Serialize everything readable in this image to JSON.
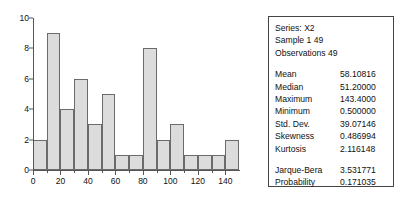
{
  "chart_data": {
    "type": "bar",
    "title": "",
    "xlabel": "",
    "ylabel": "",
    "bin_width": 10,
    "bin_start": 0,
    "grid": false,
    "legend": "none",
    "xlim": [
      0,
      150
    ],
    "ylim": [
      0,
      10
    ],
    "yticks": [
      0,
      2,
      4,
      6,
      8,
      10
    ],
    "xticks": [
      0,
      20,
      40,
      60,
      80,
      100,
      120,
      140
    ],
    "x_minor_ticks": [
      10,
      30,
      50,
      70,
      90,
      110,
      130
    ],
    "categories": [
      "0-10",
      "10-20",
      "20-30",
      "30-40",
      "40-50",
      "50-60",
      "60-70",
      "70-80",
      "80-90",
      "90-100",
      "100-110",
      "110-120",
      "120-130",
      "130-140",
      "140-150"
    ],
    "values": [
      2,
      9,
      4,
      6,
      3,
      5,
      1,
      1,
      8,
      2,
      3,
      1,
      1,
      1,
      2
    ]
  },
  "stats": {
    "header": [
      {
        "text": "Series: X2"
      },
      {
        "text": "Sample 1 49"
      },
      {
        "text": "Observations 49"
      }
    ],
    "rows": [
      {
        "label": "Mean",
        "value": "58.10816"
      },
      {
        "label": "Median",
        "value": "51.20000"
      },
      {
        "label": "Maximum",
        "value": "143.4000"
      },
      {
        "label": "Minimum",
        "value": "0.500000"
      },
      {
        "label": "Std. Dev.",
        "value": "39.07146"
      },
      {
        "label": "Skewness",
        "value": "0.486994"
      },
      {
        "label": "Kurtosis",
        "value": "2.116148"
      }
    ],
    "test_rows": [
      {
        "label": "Jarque-Bera",
        "value": "3.531771"
      },
      {
        "label": "Probability",
        "value": "0.171035"
      }
    ]
  },
  "colors": {
    "bar_fill": "#dcdcdc",
    "bar_stroke": "#6b6b6b",
    "axis": "#555555",
    "box_border": "#444444",
    "text": "#111111"
  }
}
